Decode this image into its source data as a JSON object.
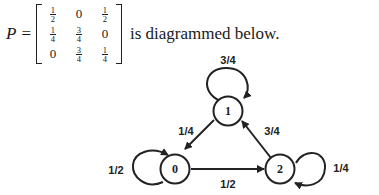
{
  "equation": {
    "symbol": "P",
    "equals": "=",
    "matrix": [
      [
        {
          "n": "1",
          "d": "2"
        },
        "0",
        {
          "n": "1",
          "d": "2"
        }
      ],
      [
        {
          "n": "1",
          "d": "4"
        },
        {
          "n": "3",
          "d": "4"
        },
        "0"
      ],
      [
        "0",
        {
          "n": "3",
          "d": "4"
        },
        {
          "n": "1",
          "d": "4"
        }
      ]
    ],
    "trailing_text": "is diagrammed below."
  },
  "diagram": {
    "nodes": [
      {
        "id": "0",
        "label": "0"
      },
      {
        "id": "1",
        "label": "1"
      },
      {
        "id": "2",
        "label": "2"
      }
    ],
    "edges": [
      {
        "from": "0",
        "to": "0",
        "label": "1/2"
      },
      {
        "from": "0",
        "to": "2",
        "label": "1/2"
      },
      {
        "from": "1",
        "to": "1",
        "label": "3/4"
      },
      {
        "from": "1",
        "to": "0",
        "label": "1/4"
      },
      {
        "from": "2",
        "to": "2",
        "label": "1/4"
      },
      {
        "from": "2",
        "to": "1",
        "label": "3/4"
      }
    ]
  }
}
